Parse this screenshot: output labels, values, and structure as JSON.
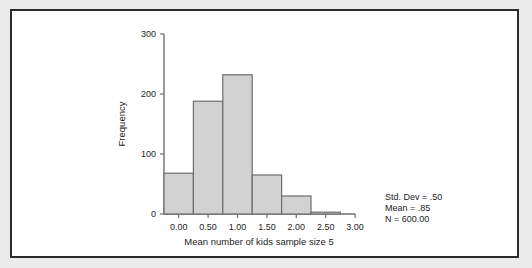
{
  "figure": {
    "background_color": "#ffffff",
    "page_color": "#ebebeb",
    "frame_color": "#2b2b2b"
  },
  "chart_data": {
    "type": "bar",
    "chart_subtype": "histogram",
    "title": "",
    "xlabel": "Mean number of kids sample size 5",
    "ylabel": "Frequency",
    "xlim": [
      -0.25,
      3.0
    ],
    "ylim": [
      0,
      300
    ],
    "grid": false,
    "legend": null,
    "bar_fill_color": "#d2d2d2",
    "bar_edge_color": "#6d6d6d",
    "axis_color": "#6f6f6f",
    "xticks": [
      0.0,
      0.5,
      1.0,
      1.5,
      2.0,
      2.5,
      3.0
    ],
    "xtick_labels": [
      "0.00",
      "0.50",
      "1.00",
      "1.50",
      "2.00",
      "2.50",
      "3.00"
    ],
    "yticks": [
      0,
      100,
      200,
      300
    ],
    "ytick_labels": [
      "0",
      "100",
      "200",
      "300"
    ],
    "bin_width": 0.5,
    "bin_starts": [
      -0.25,
      0.25,
      0.75,
      1.25,
      1.75,
      2.25
    ],
    "bin_centers": [
      0.0,
      0.5,
      1.0,
      1.5,
      2.0,
      2.5
    ],
    "values": [
      68,
      188,
      232,
      65,
      30,
      3
    ],
    "categories": [
      "0.00",
      "0.50",
      "1.00",
      "1.50",
      "2.00",
      "2.50"
    ]
  },
  "annotations": {
    "std_dev": "Std. Dev = .50",
    "mean": "Mean = .85",
    "n_symbol": "N",
    "n_value": " = 600.00"
  }
}
